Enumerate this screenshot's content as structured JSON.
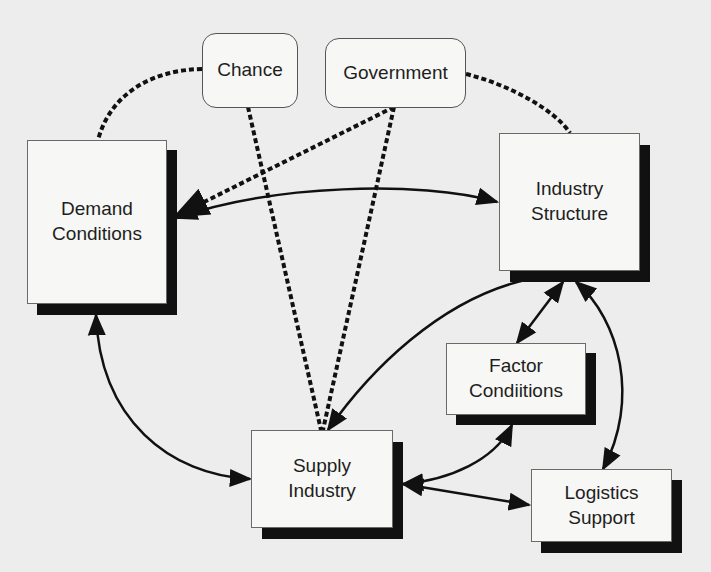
{
  "diagram": {
    "type": "influence diagram",
    "colors": {
      "background": "#ededed",
      "box_fill": "#f7f7f5",
      "shadow": "#111111",
      "line": "#111111"
    },
    "external_factors": [
      {
        "id": "chance",
        "label": "Chance"
      },
      {
        "id": "government",
        "label": "Government"
      }
    ],
    "nodes": [
      {
        "id": "demand",
        "label": "Demand\nConditions"
      },
      {
        "id": "industry",
        "label": "Industry\nStructure"
      },
      {
        "id": "factor",
        "label": "Factor\nCondiitions"
      },
      {
        "id": "supply",
        "label": "Supply\nIndustry"
      },
      {
        "id": "logistics",
        "label": "Logistics\nSupport"
      }
    ],
    "edges": [
      {
        "from": "chance",
        "to": "demand",
        "style": "dashed"
      },
      {
        "from": "chance",
        "to": "supply",
        "style": "dashed"
      },
      {
        "from": "government",
        "to": "demand",
        "style": "dashed",
        "arrow": "end"
      },
      {
        "from": "government",
        "to": "supply",
        "style": "dashed"
      },
      {
        "from": "government",
        "to": "industry",
        "style": "dashed"
      },
      {
        "from": "demand",
        "to": "industry",
        "style": "solid",
        "arrow": "both"
      },
      {
        "from": "demand",
        "to": "supply",
        "style": "solid",
        "arrow": "both"
      },
      {
        "from": "industry",
        "to": "factor",
        "style": "solid",
        "arrow": "both"
      },
      {
        "from": "industry",
        "to": "supply",
        "style": "solid",
        "arrow": "end"
      },
      {
        "from": "industry",
        "to": "logistics",
        "style": "solid",
        "arrow": "both"
      },
      {
        "from": "supply",
        "to": "factor",
        "style": "solid",
        "arrow": "both"
      },
      {
        "from": "supply",
        "to": "logistics",
        "style": "solid",
        "arrow": "both"
      }
    ]
  }
}
